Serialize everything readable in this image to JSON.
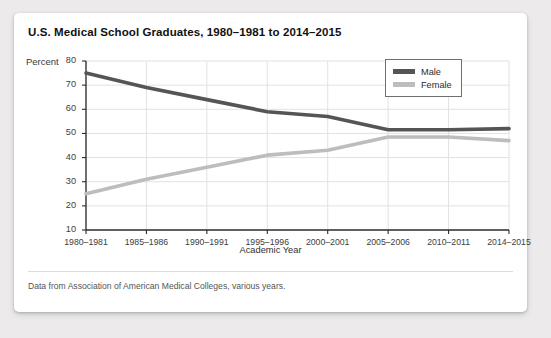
{
  "card": {
    "title": "U.S. Medical School Graduates, 1980–1981 to 2014–2015",
    "footnote": "Data from Association of American Medical Colleges, various years."
  },
  "axes": {
    "y_axis_unit_label": "Percent",
    "x_axis_title": "Academic Year"
  },
  "legend": {
    "male_label": "Male",
    "female_label": "Female",
    "male_color": "#555555",
    "female_color": "#bdbdbd"
  },
  "chart_data": {
    "type": "line",
    "title": "U.S. Medical School Graduates, 1980–1981 to 2014–2015",
    "subtitle": "",
    "xlabel": "Academic Year",
    "ylabel": "Percent",
    "categories": [
      "1980–1981",
      "1985–1986",
      "1990–1991",
      "1995–1996",
      "2000–2001",
      "2005–2006",
      "2010–2011",
      "2014–2015"
    ],
    "series": [
      {
        "name": "Male",
        "color": "#555555",
        "values": [
          75,
          69,
          64,
          59,
          57,
          51.5,
          51.5,
          52
        ]
      },
      {
        "name": "Female",
        "color": "#bdbdbd",
        "values": [
          25,
          31,
          36,
          41,
          43,
          48.5,
          48.5,
          47
        ]
      }
    ],
    "ylim": [
      10,
      80
    ],
    "yticks": [
      10,
      20,
      30,
      40,
      50,
      60,
      70,
      80
    ],
    "grid": true,
    "legend_position": "top-right"
  }
}
